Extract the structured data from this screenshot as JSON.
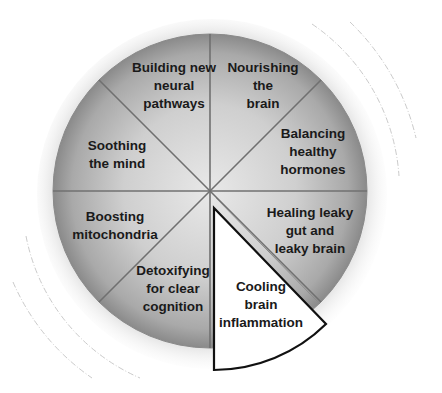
{
  "diagram": {
    "type": "segmented-wheel",
    "center": {
      "x": 210,
      "y": 191
    },
    "radius": 157,
    "segment_color_center": "#e6e6e6",
    "segment_color_edge": "#8e8e8e",
    "divider_color": "#6e6e6e",
    "highlight_fill": "#ffffff",
    "highlight_stroke": "#111111",
    "segments": [
      {
        "id": "building",
        "label": "Building new\nneural\npathways"
      },
      {
        "id": "nourishing",
        "label": "Nourishing\nthe\nbrain"
      },
      {
        "id": "balancing",
        "label": "Balancing\nhealthy\nhormones"
      },
      {
        "id": "healing",
        "label": "Healing leaky\ngut and\nleaky brain"
      },
      {
        "id": "cooling",
        "label": "Cooling\nbrain\ninflammation",
        "highlighted": true
      },
      {
        "id": "detoxifying",
        "label": "Detoxifying\nfor clear\ncognition"
      },
      {
        "id": "boosting",
        "label": "Boosting\nmitochondria"
      },
      {
        "id": "soothing",
        "label": "Soothing\nthe mind"
      }
    ]
  }
}
